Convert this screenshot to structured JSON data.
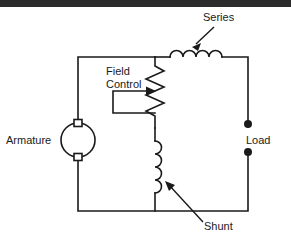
{
  "page": {
    "width": 291,
    "height": 246,
    "background_color": "#ffffff",
    "top_bar_color": "#2b2b2b",
    "stroke_color": "#1a1a1a",
    "text_color": "#1a1a1a"
  },
  "diagram": {
    "type": "electrical-schematic",
    "labels": {
      "series": "Series",
      "field_line1": "Field",
      "field_line2": "Control",
      "armature": "Armature",
      "load": "Load",
      "shunt": "Shunt"
    },
    "components": [
      {
        "name": "armature",
        "symbol": "circle-with-brushes",
        "label": "Armature",
        "cx": 78,
        "cy": 140,
        "r": 17
      },
      {
        "name": "series-field-coil",
        "symbol": "inductor-horizontal",
        "label": "Series",
        "bumps": 4
      },
      {
        "name": "field-control-rheostat",
        "symbol": "resistor-with-wiper",
        "label": "Field Control",
        "zigzags": 6
      },
      {
        "name": "shunt-field-coil",
        "symbol": "inductor-vertical",
        "label": "Shunt",
        "bumps": 4
      },
      {
        "name": "load-terminals",
        "symbol": "two-terminal-dots",
        "label": "Load",
        "terminal_count": 2
      }
    ]
  }
}
